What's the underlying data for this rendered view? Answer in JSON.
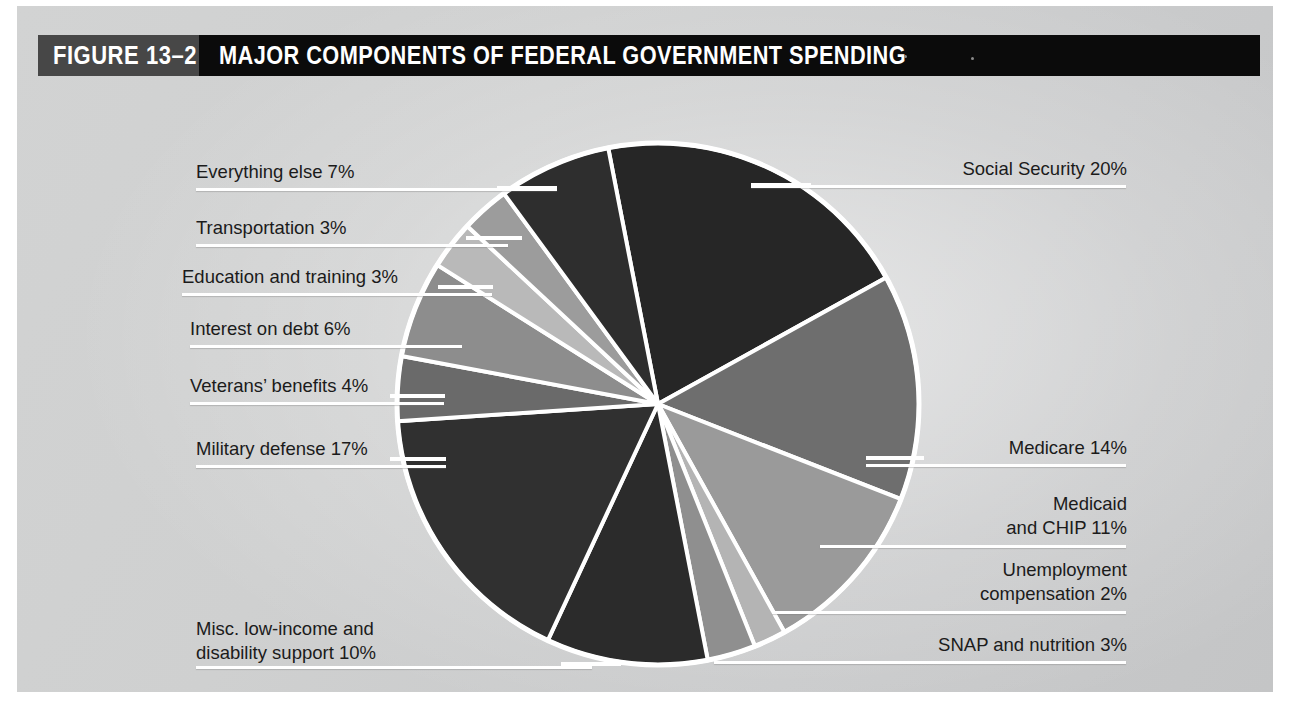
{
  "header": {
    "figure_tag": "FIGURE 13–2",
    "title": "MAJOR COMPONENTS OF FEDERAL GOVERNMENT SPENDING"
  },
  "chart_data": {
    "type": "pie",
    "title": "MAJOR COMPONENTS OF FEDERAL GOVERNMENT SPENDING",
    "units": "percent of total federal spending",
    "legend_position": "callout-labels",
    "start_angle_deg": -11,
    "categories": [
      "Social Security",
      "Medicare",
      "Medicaid and CHIP",
      "Unemployment compensation",
      "SNAP and nutrition",
      "Misc. low-income and disability support",
      "Military defense",
      "Veterans' benefits",
      "Interest on debt",
      "Education and training",
      "Transportation",
      "Everything else"
    ],
    "values": [
      20,
      14,
      11,
      2,
      3,
      10,
      17,
      4,
      6,
      3,
      3,
      7
    ],
    "colors": [
      "#262626",
      "#6e6e6e",
      "#9a9a9a",
      "#b4b4b4",
      "#8f8f8f",
      "#2b2b2b",
      "#303030",
      "#6a6a6a",
      "#8d8d8d",
      "#b9b9b9",
      "#9c9c9c",
      "#2e2e2e"
    ],
    "slice_border_color": "#ffffff"
  },
  "labels": {
    "social_security": "Social Security 20%",
    "medicare": "Medicare 14%",
    "medicaid_line1": "Medicaid",
    "medicaid_line2": "and CHIP 11%",
    "unemployment_line1": "Unemployment",
    "unemployment_line2": "compensation 2%",
    "snap": "SNAP and nutrition 3%",
    "misc_line1": "Misc. low-income and",
    "misc_line2": "disability support 10%",
    "military": "Military defense 17%",
    "veterans": "Veterans’ benefits 4%",
    "interest": "Interest on debt 6%",
    "education": "Education and training 3%",
    "transportation": "Transportation 3%",
    "everything_else": "Everything else 7%"
  }
}
